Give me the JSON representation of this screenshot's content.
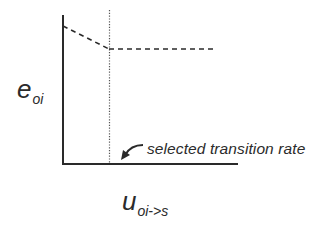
{
  "diagram": {
    "type": "line-schematic",
    "y_axis": {
      "symbol": "e",
      "subscript": "oi"
    },
    "x_axis": {
      "symbol": "u",
      "subscript": "oi->s"
    },
    "annotation": {
      "text": "selected transition rate",
      "arrow": "curved-arrow-pointing-down-left"
    },
    "colors": {
      "axis": "#2a2a2a",
      "dashed_curve": "#2a2a2a",
      "dotted_marker": "#555555",
      "text": "#2b2b2b"
    },
    "geometry": {
      "origin": [
        63,
        164
      ],
      "y_axis_top": 15,
      "x_axis_right": 237,
      "marker_x": 109,
      "marker_top": 10,
      "curve": [
        [
          63,
          26
        ],
        [
          109,
          49
        ],
        [
          215,
          49
        ]
      ]
    }
  }
}
